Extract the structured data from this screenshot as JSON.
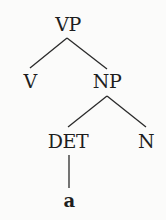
{
  "diagram": {
    "type": "syntax-tree",
    "nodes": {
      "vp": {
        "label": "VP",
        "x": 68,
        "y": 13
      },
      "v": {
        "label": "V",
        "x": 30,
        "y": 70
      },
      "np": {
        "label": "NP",
        "x": 107,
        "y": 70
      },
      "det": {
        "label": "DET",
        "x": 68,
        "y": 130
      },
      "n": {
        "label": "N",
        "x": 146,
        "y": 130
      },
      "a": {
        "label": "a",
        "x": 69,
        "y": 192
      }
    },
    "edges": [
      {
        "from": "VP",
        "to": "V"
      },
      {
        "from": "VP",
        "to": "NP"
      },
      {
        "from": "NP",
        "to": "DET"
      },
      {
        "from": "NP",
        "to": "N"
      },
      {
        "from": "DET",
        "to": "a"
      }
    ],
    "colors": {
      "background": "#fbfbfa",
      "ink": "#1e1e1e"
    }
  }
}
